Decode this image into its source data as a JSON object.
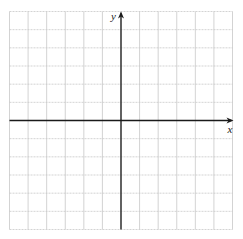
{
  "chart_data": {
    "type": "scatter",
    "title": "",
    "xlabel": "x",
    "ylabel": "y",
    "xlim": [
      -6,
      6
    ],
    "ylim": [
      -6,
      6
    ],
    "grid": true,
    "tick_step": 1,
    "tick_labels_shown": false,
    "series": []
  },
  "colors": {
    "grid": "#c8c8c8",
    "axis": "#1a1a1a",
    "background": "#ffffff"
  },
  "labels": {
    "x_axis": "x",
    "y_axis": "y"
  }
}
